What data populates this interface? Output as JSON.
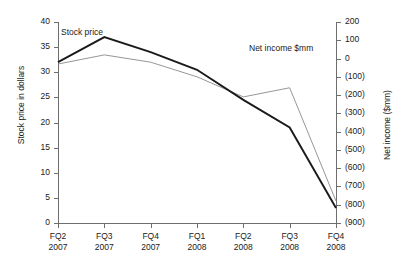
{
  "chart_data": {
    "type": "line",
    "title": "",
    "xlabel": "",
    "categories": [
      "FQ2 2007",
      "FQ3 2007",
      "FQ4 2007",
      "FQ1 2008",
      "FQ2 2008",
      "FQ3 2008",
      "FQ4 2008"
    ],
    "category_lines": [
      {
        "quarter": "FQ2",
        "year": "2007"
      },
      {
        "quarter": "FQ3",
        "year": "2007"
      },
      {
        "quarter": "FQ4",
        "year": "2007"
      },
      {
        "quarter": "FQ1",
        "year": "2008"
      },
      {
        "quarter": "FQ2",
        "year": "2008"
      },
      {
        "quarter": "FQ3",
        "year": "2008"
      },
      {
        "quarter": "FQ4",
        "year": "2008"
      }
    ],
    "grid": false,
    "legend_position": "inline-annotations",
    "series": [
      {
        "name": "Stock price",
        "axis": "left",
        "ylabel": "Stock price in dollars",
        "unit": "dollars",
        "color": "#1a1a1a",
        "stroke_width": 1.9,
        "values": [
          32,
          37,
          34,
          30.5,
          24.5,
          19,
          3
        ],
        "label": "Stock price",
        "ylim": [
          0,
          40
        ],
        "yticks": [
          0,
          5,
          10,
          15,
          20,
          25,
          30,
          35,
          40
        ],
        "ytick_labels": [
          "0",
          "5",
          "10",
          "15",
          "20",
          "25",
          "30",
          "35",
          "40"
        ]
      },
      {
        "name": "Net income $mm",
        "axis": "right",
        "ylabel": "Net income ($mm)",
        "unit": "$mm",
        "color": "#8a8a8a",
        "stroke_width": 0.9,
        "values": [
          -30,
          20,
          -20,
          -100,
          -210,
          -160,
          -780
        ],
        "label": "Net income $mm",
        "ylim": [
          -900,
          200
        ],
        "yticks": [
          200,
          100,
          0,
          -100,
          -200,
          -300,
          -400,
          -500,
          -600,
          -700,
          -800,
          -900
        ],
        "ytick_labels": [
          "200",
          "100",
          "0",
          "(100)",
          "(200)",
          "(300)",
          "(400)",
          "(500)",
          "(600)",
          "(700)",
          "(800)",
          "(900)"
        ]
      }
    ]
  },
  "axes": {
    "left": {
      "title": "Stock price in dollars",
      "ticks": [
        "40",
        "35",
        "30",
        "25",
        "20",
        "15",
        "10",
        "5",
        "0"
      ]
    },
    "right": {
      "title": "Net income ($mm)",
      "ticks": [
        "200",
        "100",
        "0",
        "(100)",
        "(200)",
        "(300)",
        "(400)",
        "(500)",
        "(600)",
        "(700)",
        "(800)",
        "(900)"
      ]
    },
    "x": {
      "quarters": [
        "FQ2",
        "FQ3",
        "FQ4",
        "FQ1",
        "FQ2",
        "FQ3",
        "FQ4"
      ],
      "years": [
        "2007",
        "2007",
        "2007",
        "2008",
        "2008",
        "2008",
        "2008"
      ]
    }
  },
  "annotations": {
    "stock_price_label": "Stock price",
    "net_income_label": "Net income $mm"
  },
  "colors": {
    "stock_line": "#1a1a1a",
    "net_income_line": "#8a8a8a",
    "axis": "#6e6e6e",
    "text": "#1a1a1a",
    "background": "#ffffff"
  }
}
